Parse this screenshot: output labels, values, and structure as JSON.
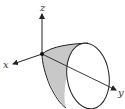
{
  "figure": {
    "type": "3d-surface-diagram",
    "surface": "paraboloid",
    "axes": {
      "x": {
        "label": "x"
      },
      "y": {
        "label": "y"
      },
      "z": {
        "label": "z"
      }
    },
    "colors": {
      "stroke": "#222222",
      "shading": "#c8c8c8",
      "background": "#ffffff"
    }
  }
}
